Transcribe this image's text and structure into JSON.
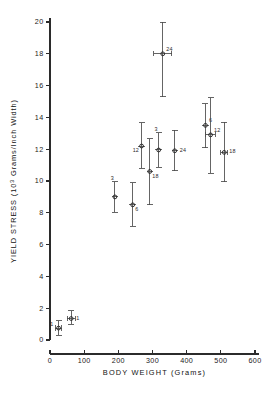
{
  "chart_data": {
    "type": "scatter",
    "title": "",
    "xlabel": "BODY WEIGHT (Grams)",
    "ylabel_main": "YIELD STRESS",
    "ylabel_units_prefix": "(10",
    "ylabel_units_exp": "3",
    "ylabel_units_suffix": " Grams/Inch  Width)",
    "xlim": [
      0,
      600
    ],
    "ylim": [
      0,
      20
    ],
    "xticks": [
      0,
      100,
      200,
      300,
      400,
      500,
      600
    ],
    "xtick_labels": [
      "0",
      "100",
      "200",
      "300",
      "400",
      "500",
      "600"
    ],
    "yticks": [
      0,
      2,
      4,
      6,
      8,
      10,
      12,
      14,
      16,
      18,
      20
    ],
    "ytick_labels": [
      "0",
      "2",
      "4",
      "6",
      "8",
      "10",
      "12",
      "14",
      "16",
      "18",
      "20"
    ],
    "grid": false,
    "legend": "none",
    "error_bars": "vertical and horizontal",
    "marker_style": "open-circle-with-crosshair",
    "points": [
      {
        "id": "p1",
        "x": 25,
        "y": 0.75,
        "yerr_low": 0.45,
        "yerr_high": 0.45,
        "xerr": 9,
        "n": "1",
        "label_pos": "left"
      },
      {
        "id": "p2",
        "x": 62,
        "y": 1.35,
        "yerr_low": 0.35,
        "yerr_high": 0.5,
        "xerr": 12,
        "n": "1",
        "label_pos": "right"
      },
      {
        "id": "p3",
        "x": 190,
        "y": 9.0,
        "yerr_low": 0.95,
        "yerr_high": 0.95,
        "xerr": 0,
        "n": "3",
        "label_pos": "above-left"
      },
      {
        "id": "p4",
        "x": 242,
        "y": 8.5,
        "yerr_low": 1.35,
        "yerr_high": 1.4,
        "xerr": 0,
        "n": "6",
        "label_pos": "below-right"
      },
      {
        "id": "p5",
        "x": 268,
        "y": 12.2,
        "yerr_low": 1.4,
        "yerr_high": 1.45,
        "xerr": 0,
        "n": "12",
        "label_pos": "below-left"
      },
      {
        "id": "p6",
        "x": 292,
        "y": 10.6,
        "yerr_low": 2.1,
        "yerr_high": 2.05,
        "xerr": 0,
        "n": "18",
        "label_pos": "below-right"
      },
      {
        "id": "p7",
        "x": 318,
        "y": 11.95,
        "yerr_low": 1.1,
        "yerr_high": 1.1,
        "xerr": 0,
        "n": "3",
        "label_pos": "above-left"
      },
      {
        "id": "p8",
        "x": 330,
        "y": 18.0,
        "yerr_low": 2.7,
        "yerr_high": 2.0,
        "xerr": 27,
        "n": "24",
        "label_pos": "above-right"
      },
      {
        "id": "p9",
        "x": 365,
        "y": 11.9,
        "yerr_low": 1.25,
        "yerr_high": 1.3,
        "xerr": 0,
        "n": "24",
        "label_pos": "right"
      },
      {
        "id": "p10",
        "x": 455,
        "y": 13.5,
        "yerr_low": 1.4,
        "yerr_high": 1.35,
        "xerr": 0,
        "n": "6",
        "label_pos": "above-right"
      },
      {
        "id": "p11",
        "x": 470,
        "y": 12.9,
        "yerr_low": 2.4,
        "yerr_high": 2.35,
        "xerr": 14,
        "n": "12",
        "label_pos": "above-right"
      },
      {
        "id": "p12",
        "x": 510,
        "y": 11.8,
        "yerr_low": 1.85,
        "yerr_high": 1.9,
        "xerr": 10,
        "n": "18",
        "label_pos": "right"
      }
    ]
  }
}
